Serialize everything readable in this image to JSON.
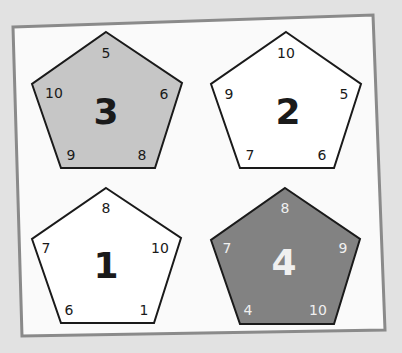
{
  "colors": {
    "page_background": "#e2e2e2",
    "frame_fill": "#fafafa",
    "frame_border": "#8a8a8a",
    "outline": "#1a1a1a",
    "light_gray_fill": "#c6c6c6",
    "dark_gray_fill": "#828282",
    "white_fill": "#ffffff",
    "dark_text": "#1a1a1a",
    "light_text": "#f0f0f0"
  },
  "pentagons": [
    {
      "id": "pentagon-3",
      "label": "3",
      "fill": "light-gray",
      "vertices": {
        "top": "5",
        "right": "6",
        "bottom_right": "8",
        "bottom_left": "9",
        "left": "10"
      }
    },
    {
      "id": "pentagon-2",
      "label": "2",
      "fill": "white",
      "vertices": {
        "top": "10",
        "right": "5",
        "bottom_right": "6",
        "bottom_left": "7",
        "left": "9"
      }
    },
    {
      "id": "pentagon-1",
      "label": "1",
      "fill": "white",
      "vertices": {
        "top": "8",
        "right": "10",
        "bottom_right": "1",
        "bottom_left": "6",
        "left": "7"
      }
    },
    {
      "id": "pentagon-4",
      "label": "4",
      "fill": "dark-gray",
      "vertices": {
        "top": "8",
        "right": "9",
        "bottom_right": "10",
        "bottom_left": "4",
        "left": "7"
      }
    }
  ]
}
